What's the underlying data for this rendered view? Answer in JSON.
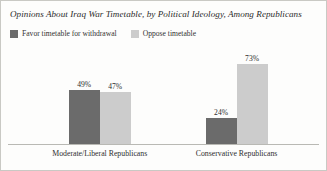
{
  "chart_data": {
    "type": "bar",
    "title": "Opinions About Iraq War Timetable, by Political Ideology, Among Republicans",
    "xlabel": "",
    "ylabel": "",
    "ylim": [
      0,
      80
    ],
    "grid": false,
    "legend_position": "top-left",
    "value_suffix": "%",
    "categories": [
      "Moderate/Liberal Republicans",
      "Conservative Republicans"
    ],
    "series": [
      {
        "name": "Favor timetable for withdrawal",
        "color": "#6b6b6b",
        "values": [
          49,
          47
        ],
        "labels": [
          "49%",
          "47%"
        ]
      },
      {
        "name": "Oppose timetable",
        "color": "#cccccc",
        "values": [
          24,
          73
        ],
        "labels": [
          "24%",
          "73%"
        ]
      }
    ],
    "groups": [
      {
        "category": "Moderate/Liberal Republicans",
        "bars": [
          {
            "series": "Favor timetable for withdrawal",
            "value": 49,
            "label": "49%",
            "color": "#6b6b6b"
          },
          {
            "series": "Oppose timetable",
            "value": 47,
            "label": "47%",
            "color": "#cccccc"
          }
        ]
      },
      {
        "category": "Conservative Republicans",
        "bars": [
          {
            "series": "Favor timetable for withdrawal",
            "value": 24,
            "label": "24%",
            "color": "#6b6b6b"
          },
          {
            "series": "Oppose timetable",
            "value": 73,
            "label": "73%",
            "color": "#cccccc"
          }
        ]
      }
    ]
  },
  "legend": {
    "items": [
      {
        "label": "Favor timetable for withdrawal",
        "color": "#6b6b6b"
      },
      {
        "label": "Oppose timetable",
        "color": "#cccccc"
      }
    ]
  },
  "colors": {
    "favor": "#6b6b6b",
    "oppose": "#cccccc",
    "axis": "#b9b9b4",
    "frame": "#c9c9c4",
    "text": "#2b2b2b",
    "background": "#fdfdfc"
  }
}
